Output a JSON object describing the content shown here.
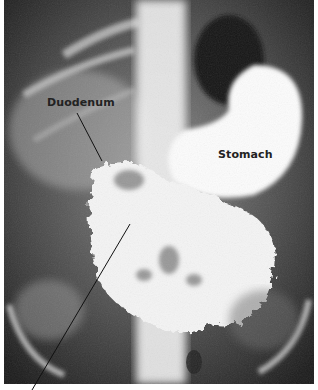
{
  "figure": {
    "type": "abdominal x-ray (barium contrast radiograph)",
    "labels": [
      {
        "id": "duodenum",
        "text": "Duodenum"
      },
      {
        "id": "stomach",
        "text": "Stomach"
      }
    ],
    "leader_lines": [
      {
        "from_label": "duodenum",
        "to": "duodenal loop"
      },
      {
        "from_label": "off-image (cropped)",
        "to": "small intestine"
      }
    ],
    "colors": {
      "background": "#ffffff",
      "label_text": "#222222",
      "film_dark": "#1e1e1e",
      "contrast_white": "#fafafa"
    }
  }
}
